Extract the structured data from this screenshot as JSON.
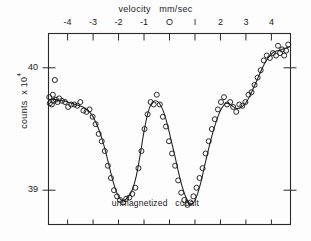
{
  "chart_data": {
    "type": "scatter",
    "title": "velocity   mm/sec",
    "xlabel": "velocity   mm/sec",
    "ylabel": "counts  x 10",
    "ylabel_exponent": "4",
    "annotation": "unmagnetized   cobalt",
    "xlim": [
      -4.75,
      4.75
    ],
    "ylim": [
      38.72,
      40.28
    ],
    "xticks": [
      -4,
      -3,
      -2,
      -1,
      0,
      1,
      2,
      3,
      4
    ],
    "xtick_labels": [
      "-4",
      "-3",
      "-2",
      "-1",
      "O",
      "I",
      "2",
      "3",
      "4"
    ],
    "yticks": [
      39,
      40
    ],
    "ytick_labels": [
      "39",
      "40"
    ],
    "grid": false,
    "legend": false,
    "marker": "open-circle",
    "line_style": "solid-fit-curve",
    "series": [
      {
        "name": "counts",
        "x": [
          -4.72,
          -4.7,
          -4.62,
          -4.58,
          -4.55,
          -4.5,
          -4.46,
          -4.4,
          -4.33,
          -4.22,
          -4.1,
          -3.98,
          -3.86,
          -3.74,
          -3.62,
          -3.5,
          -3.38,
          -3.26,
          -3.14,
          -3.02,
          -2.9,
          -2.78,
          -2.66,
          -2.54,
          -2.42,
          -2.3,
          -2.18,
          -2.06,
          -1.94,
          -1.82,
          -1.7,
          -1.58,
          -1.46,
          -1.34,
          -1.22,
          -1.1,
          -0.98,
          -0.86,
          -0.74,
          -0.62,
          -0.5,
          -0.38,
          -0.26,
          -0.14,
          -0.02,
          0.1,
          0.22,
          0.34,
          0.46,
          0.58,
          0.7,
          0.82,
          0.94,
          1.06,
          1.18,
          1.3,
          1.42,
          1.54,
          1.66,
          1.78,
          1.9,
          2.02,
          2.14,
          2.26,
          2.38,
          2.5,
          2.62,
          2.74,
          2.86,
          2.98,
          3.1,
          3.22,
          3.34,
          3.46,
          3.58,
          3.7,
          3.82,
          3.94,
          4.06,
          4.18,
          4.26,
          4.34,
          4.42,
          4.5,
          4.58,
          4.66
        ],
        "y": [
          39.76,
          39.71,
          39.7,
          39.78,
          39.73,
          39.9,
          39.74,
          39.72,
          39.75,
          39.73,
          39.72,
          39.68,
          39.7,
          39.7,
          39.69,
          39.72,
          39.65,
          39.64,
          39.66,
          39.6,
          39.54,
          39.46,
          39.4,
          39.32,
          39.2,
          39.1,
          39.0,
          38.95,
          38.92,
          38.9,
          38.93,
          38.94,
          38.97,
          39.02,
          39.18,
          39.32,
          39.5,
          39.62,
          39.72,
          39.7,
          39.78,
          39.7,
          39.6,
          39.52,
          39.4,
          39.3,
          39.2,
          39.08,
          38.98,
          38.92,
          38.88,
          38.9,
          38.95,
          39.02,
          39.1,
          39.18,
          39.3,
          39.4,
          39.5,
          39.58,
          39.66,
          39.72,
          39.76,
          39.7,
          39.72,
          39.68,
          39.64,
          39.7,
          39.69,
          39.72,
          39.78,
          39.8,
          39.86,
          39.92,
          39.98,
          40.06,
          40.1,
          40.08,
          40.12,
          40.1,
          40.18,
          40.12,
          40.15,
          40.1,
          40.14,
          40.19
        ]
      }
    ],
    "fit_curve": {
      "name": "fitted-curve",
      "x": [
        -4.75,
        -4.6,
        -4.45,
        -4.3,
        -4.15,
        -4.0,
        -3.85,
        -3.7,
        -3.55,
        -3.4,
        -3.25,
        -3.1,
        -2.95,
        -2.8,
        -2.65,
        -2.5,
        -2.35,
        -2.2,
        -2.05,
        -1.9,
        -1.75,
        -1.6,
        -1.45,
        -1.3,
        -1.15,
        -1.0,
        -0.85,
        -0.7,
        -0.55,
        -0.4,
        -0.25,
        -0.1,
        0.05,
        0.2,
        0.35,
        0.5,
        0.65,
        0.8,
        0.95,
        1.1,
        1.25,
        1.4,
        1.55,
        1.7,
        1.85,
        2.0,
        2.15,
        2.3,
        2.45,
        2.6,
        2.75,
        2.9,
        3.05,
        3.2,
        3.35,
        3.5,
        3.65,
        3.8,
        3.95,
        4.1,
        4.25,
        4.4,
        4.55,
        4.7
      ],
      "y": [
        39.74,
        39.74,
        39.74,
        39.73,
        39.73,
        39.72,
        39.71,
        39.7,
        39.69,
        39.68,
        39.66,
        39.63,
        39.58,
        39.51,
        39.42,
        39.31,
        39.18,
        39.06,
        38.97,
        38.92,
        38.92,
        38.95,
        39.01,
        39.12,
        39.29,
        39.48,
        39.63,
        39.71,
        39.73,
        39.71,
        39.65,
        39.55,
        39.42,
        39.29,
        39.15,
        39.03,
        38.94,
        38.89,
        38.9,
        38.97,
        39.08,
        39.22,
        39.35,
        39.47,
        39.57,
        39.65,
        39.7,
        39.71,
        39.69,
        39.67,
        39.67,
        39.69,
        39.73,
        39.79,
        39.86,
        39.93,
        40.0,
        40.06,
        40.1,
        40.13,
        40.14,
        40.15,
        40.16,
        40.17
      ]
    }
  },
  "figure": {
    "frame_color": "#2a2a2a",
    "marker_color": "#1f1f1f",
    "curve_color": "#1f1f1f",
    "background": "#ffffff"
  }
}
